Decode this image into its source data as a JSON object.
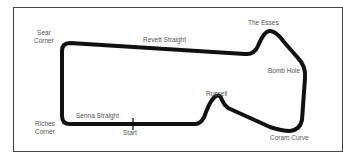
{
  "map": {
    "type": "race-circuit-layout",
    "colors": {
      "track": "#111111",
      "border": "#444444",
      "label": "#555555",
      "background": "#ffffff"
    },
    "labels": {
      "sear_corner_line1": "Sear",
      "sear_corner_line2": "Corner",
      "revett_straight": "Revett Straight",
      "the_esses": "The Esses",
      "bomb_hole": "Bomb Hole",
      "russell": "Russell",
      "riches_corner_line1": "Riches",
      "riches_corner_line2": "Corner",
      "senna_straight": "Senna Straight",
      "start": "Start",
      "coram_curve": "Coram Curve"
    }
  }
}
